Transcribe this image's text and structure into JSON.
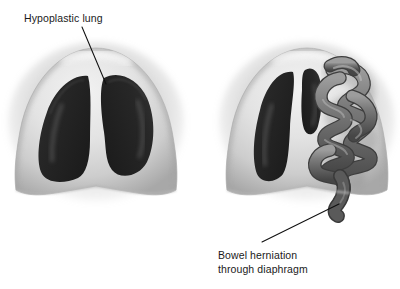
{
  "figure": {
    "background_color": "#ffffff"
  },
  "annotations": [
    {
      "id": "hypoplastic-lung",
      "lines": [
        "Hypoplastic lung"
      ],
      "text_x": 24,
      "text_y": 22,
      "leader_from": [
        82,
        27
      ],
      "leader_to": [
        106,
        84
      ]
    },
    {
      "id": "bowel-herniation",
      "lines": [
        "Bowel herniation",
        "through diaphragm"
      ],
      "text_x": 218,
      "text_y": 259,
      "leader_from": [
        262,
        242
      ],
      "leader_to": [
        339,
        204
      ]
    }
  ],
  "panels": [
    {
      "id": "left-thorax-normal",
      "label": "Thorax with both lungs",
      "center_x": 96,
      "lungs": [
        "right-lung",
        "left-lung"
      ],
      "has_bowel": false
    },
    {
      "id": "right-thorax-hernia",
      "label": "Thorax with hypoplastic lung and herniated bowel",
      "center_x": 307,
      "lungs": [
        "right-lung",
        "hypoplastic-lung"
      ],
      "has_bowel": true
    }
  ],
  "colors": {
    "thorax_wall_light": "#e4e4e4",
    "thorax_wall_mid": "#cfcfcf",
    "thorax_wall_shadow": "#9e9e9e",
    "thorax_outline": "#b4b4b4",
    "lung_dark": "#262626",
    "lung_mid": "#3a3a3a",
    "lung_highlight": "#6d6d6d",
    "bowel_mid": "#6f6f6f",
    "bowel_dark": "#4a4a4a",
    "bowel_highlight": "#b9b9b9",
    "leader_line": "#101010",
    "label_text": "#1a1a1a"
  }
}
